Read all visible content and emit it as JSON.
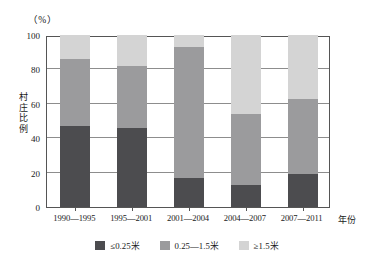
{
  "chart_data": {
    "type": "bar",
    "title": "",
    "subtitle": "",
    "stacked": true,
    "unit_label": "（%）",
    "xlabel": "年份",
    "ylabel": "村庄比例",
    "ylim": [
      0,
      100
    ],
    "yticks": [
      0,
      20,
      40,
      60,
      80,
      100
    ],
    "ytick_labels": [
      "0",
      "20",
      "40",
      "60",
      "80",
      "100"
    ],
    "grid": true,
    "grid_axis": "y",
    "legend_position": "bottom",
    "categories": [
      "1990—1995",
      "1995—2001",
      "2001—2004",
      "2004—2007",
      "2007—2011"
    ],
    "series": [
      {
        "name": "≤0.25米",
        "color": "#4c4c4f",
        "values": [
          47,
          46,
          17,
          13,
          19
        ]
      },
      {
        "name": "0.25—1.5米",
        "color": "#9b9b9d",
        "values": [
          39,
          36,
          76,
          41,
          44
        ]
      },
      {
        "name": "≥1.5米",
        "color": "#d4d4d4",
        "values": [
          14,
          18,
          7,
          46,
          37
        ]
      }
    ],
    "cumulative_tops": [
      [
        47,
        86,
        100
      ],
      [
        46,
        82,
        100
      ],
      [
        17,
        93,
        100
      ],
      [
        13,
        54,
        100
      ],
      [
        19,
        63,
        100
      ]
    ]
  },
  "axis": {
    "unit": "（%）",
    "y_title_chars": "村庄比例",
    "x_title": "年份"
  },
  "legend": {
    "items": [
      {
        "label": "≤0.25米",
        "color": "#4c4c4f"
      },
      {
        "label": "0.25—1.5米",
        "color": "#9b9b9d"
      },
      {
        "label": "≥1.5米",
        "color": "#d4d4d4"
      }
    ]
  }
}
